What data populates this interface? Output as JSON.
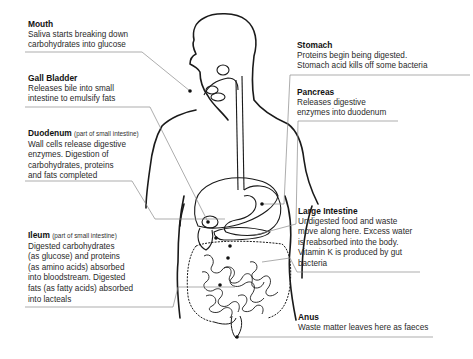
{
  "diagram": {
    "colors": {
      "outline": "#1a1a1a",
      "leader_line": "#8a8a8a",
      "text": "#2a2a2a",
      "heading": "#111111"
    },
    "labels": [
      {
        "id": "mouth",
        "title": "Mouth",
        "subtitle": "",
        "body": "Saliva starts breaking down\ncarbohydrates into glucose"
      },
      {
        "id": "gall-bladder",
        "title": "Gall Bladder",
        "subtitle": "",
        "body": "Releases bile into small\nintestine to emulsify fats"
      },
      {
        "id": "duodenum",
        "title": "Duodenum",
        "subtitle": "(part of small intestine)",
        "body": "Wall cells release digestive\nenzymes. Digestion of\ncarbohydrates, proteins\nand fats completed"
      },
      {
        "id": "ileum",
        "title": "Ileum",
        "subtitle": "(part of small intestine)",
        "body": "Digested carbohydrates\n(as glucose) and proteins\n(as amino acids) absorbed\ninto bloodstream. Digested\nfats (as fatty acids) absorbed\ninto lacteals"
      },
      {
        "id": "stomach",
        "title": "Stomach",
        "subtitle": "",
        "body": "Proteins begin being digested.\nStomach acid kills off some bacteria"
      },
      {
        "id": "pancreas",
        "title": "Pancreas",
        "subtitle": "",
        "body": "Releases digestive\nenzymes into duodenum"
      },
      {
        "id": "large-intestine",
        "title": "Large Intestine",
        "subtitle": "",
        "body": "Undigested food and waste\nmove along here. Excess water\nis reabsorbed into the body.\nVitamin K is produced by gut\nbacteria"
      },
      {
        "id": "anus",
        "title": "Anus",
        "subtitle": "",
        "body": "Waste matter leaves here as faeces"
      }
    ]
  }
}
